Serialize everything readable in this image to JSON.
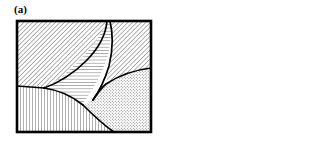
{
  "figure": {
    "background_color": "#ffffff",
    "line_color": "#000000",
    "hatch_color": "#4d4d4d",
    "frame_color": "#000000",
    "width": 334,
    "height": 144
  },
  "panels": [
    {
      "id": "a",
      "label": "(a)",
      "frame": {
        "x": 2,
        "y": 2,
        "width": 136,
        "height": 113
      },
      "description": "Coarse grain structure with four grains separated by curved grain boundaries",
      "grain_count": 4,
      "grains": [
        {
          "name": "grain-top-left",
          "hatch": "diagonal-45",
          "hatch_spacing": 3
        },
        {
          "name": "grain-top-right",
          "hatch": "diagonal-45",
          "hatch_spacing": 3
        },
        {
          "name": "grain-center",
          "hatch": "horizontal",
          "hatch_spacing": 3
        },
        {
          "name": "grain-bottom-left",
          "hatch": "vertical",
          "hatch_spacing": 3
        },
        {
          "name": "grain-bottom-right",
          "hatch": "stipple",
          "hatch_spacing": 3
        }
      ]
    },
    {
      "id": "b",
      "label": "(b)",
      "frame": {
        "x": 2,
        "y": 2,
        "width": 136,
        "height": 113
      },
      "description": "Fine grain structure with many grains, numerous straight and curved boundaries, and annealing twins in the central grain",
      "grain_count": 16,
      "grains": [
        {
          "name": "grain-b-01",
          "hatch": "horizontal",
          "hatch_spacing": 3
        },
        {
          "name": "grain-b-02",
          "hatch": "vertical",
          "hatch_spacing": 3
        },
        {
          "name": "grain-b-03",
          "hatch": "diagonal-45",
          "hatch_spacing": 3
        },
        {
          "name": "grain-b-04",
          "hatch": "vertical",
          "hatch_spacing": 3
        },
        {
          "name": "grain-b-05",
          "hatch": "horizontal",
          "hatch_spacing": 3
        },
        {
          "name": "grain-b-06",
          "hatch": "diagonal-135",
          "hatch_spacing": 3
        },
        {
          "name": "grain-b-07",
          "hatch": "vertical",
          "hatch_spacing": 3
        },
        {
          "name": "grain-b-08",
          "hatch": "diagonal-45",
          "hatch_spacing": 3
        },
        {
          "name": "grain-b-09",
          "hatch": "horizontal",
          "hatch_spacing": 3
        },
        {
          "name": "grain-b-10",
          "hatch": "vertical",
          "hatch_spacing": 3
        },
        {
          "name": "grain-b-11",
          "hatch": "diagonal-45",
          "hatch_spacing": 3
        },
        {
          "name": "grain-b-12",
          "hatch": "vertical",
          "hatch_spacing": 3
        },
        {
          "name": "grain-b-13",
          "hatch": "horizontal",
          "hatch_spacing": 3
        },
        {
          "name": "grain-b-14",
          "hatch": "vertical",
          "hatch_spacing": 3
        },
        {
          "name": "grain-b-15",
          "hatch": "diagonal-45",
          "hatch_spacing": 3
        },
        {
          "name": "grain-b-16",
          "hatch": "vertical",
          "hatch_spacing": 3
        }
      ],
      "twin_bands": 3
    }
  ]
}
